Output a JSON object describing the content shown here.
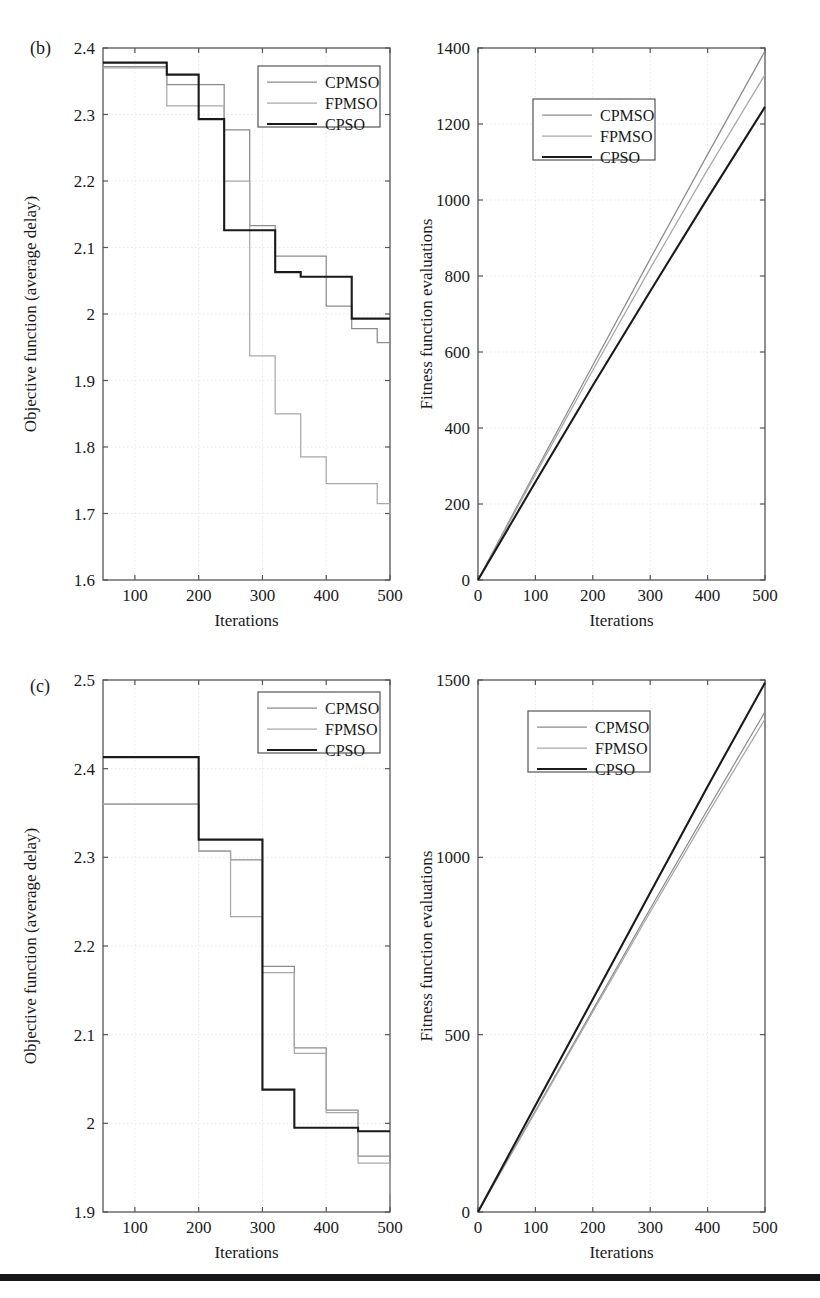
{
  "figure": {
    "panels": [
      "b",
      "c"
    ],
    "series_names": [
      "CPMSO",
      "FPMSO",
      "CPSO"
    ],
    "series_colors": [
      "#8c8c8c",
      "#a8a8a8",
      "#1a1a1a"
    ],
    "bottom_rule_color": "#17171a"
  },
  "panel_b": {
    "tag": "(b)",
    "left": {
      "xlabel": "Iterations",
      "ylabel": "Objective function (average delay)",
      "xticks": [
        "100",
        "200",
        "300",
        "400",
        "500"
      ],
      "yticks": [
        "1.6",
        "1.7",
        "1.8",
        "1.9",
        "2",
        "2.1",
        "2.2",
        "2.3",
        "2.4"
      ],
      "legend": [
        "CPMSO",
        "FPMSO",
        "CPSO"
      ]
    },
    "right": {
      "xlabel": "Iterations",
      "ylabel": "Fitness function evaluations",
      "xticks": [
        "0",
        "100",
        "200",
        "300",
        "400",
        "500"
      ],
      "yticks": [
        "0",
        "200",
        "400",
        "600",
        "800",
        "1000",
        "1200",
        "1400"
      ],
      "legend": [
        "CPMSO",
        "FPMSO",
        "CPSO"
      ]
    }
  },
  "panel_c": {
    "tag": "(c)",
    "left": {
      "xlabel": "Iterations",
      "ylabel": "Objective function (average delay)",
      "xticks": [
        "100",
        "200",
        "300",
        "400",
        "500"
      ],
      "yticks": [
        "1.9",
        "2",
        "2.1",
        "2.2",
        "2.3",
        "2.4",
        "2.5"
      ],
      "legend": [
        "CPMSO",
        "FPMSO",
        "CPSO"
      ]
    },
    "right": {
      "xlabel": "Iterations",
      "ylabel": "Fitness function evaluations",
      "xticks": [
        "0",
        "100",
        "200",
        "300",
        "400",
        "500"
      ],
      "yticks": [
        "0",
        "500",
        "1000",
        "1500"
      ],
      "legend": [
        "CPMSO",
        "FPMSO",
        "CPSO"
      ]
    }
  },
  "chart_data": [
    {
      "id": "b-left",
      "type": "line",
      "step": true,
      "title": "(b) Objective function vs iterations",
      "xlabel": "Iterations",
      "ylabel": "Objective function (average delay)",
      "xlim": [
        50,
        500
      ],
      "ylim": [
        1.6,
        2.4
      ],
      "xticks": [
        100,
        200,
        300,
        400,
        500
      ],
      "yticks": [
        1.6,
        1.7,
        1.8,
        1.9,
        2.0,
        2.1,
        2.2,
        2.3,
        2.4
      ],
      "grid": true,
      "legend_position": "top-right",
      "series": [
        {
          "name": "CPMSO",
          "color": "#8c8c8c",
          "x": [
            50,
            100,
            150,
            200,
            240,
            280,
            320,
            360,
            400,
            440,
            480,
            500
          ],
          "values": [
            2.372,
            2.372,
            2.345,
            2.345,
            2.277,
            2.133,
            2.087,
            2.087,
            2.012,
            1.978,
            1.957,
            1.937
          ]
        },
        {
          "name": "FPMSO",
          "color": "#a8a8a8",
          "x": [
            50,
            100,
            150,
            200,
            240,
            280,
            320,
            360,
            400,
            440,
            480,
            500
          ],
          "values": [
            2.37,
            2.37,
            2.313,
            2.313,
            2.2,
            1.937,
            1.85,
            1.785,
            1.745,
            1.745,
            1.715,
            1.699
          ]
        },
        {
          "name": "CPSO",
          "color": "#1a1a1a",
          "x": [
            50,
            100,
            150,
            200,
            240,
            280,
            320,
            360,
            400,
            440,
            480,
            500
          ],
          "values": [
            2.378,
            2.378,
            2.36,
            2.293,
            2.126,
            2.126,
            2.063,
            2.056,
            2.056,
            1.993,
            1.993,
            1.993
          ]
        }
      ]
    },
    {
      "id": "b-right",
      "type": "line",
      "step": false,
      "title": "(b) Fitness function evaluations vs iterations",
      "xlabel": "Iterations",
      "ylabel": "Fitness function evaluations",
      "xlim": [
        0,
        500
      ],
      "ylim": [
        0,
        1400
      ],
      "xticks": [
        0,
        100,
        200,
        300,
        400,
        500
      ],
      "yticks": [
        0,
        200,
        400,
        600,
        800,
        1000,
        1200,
        1400
      ],
      "grid": true,
      "legend_position": "upper-center",
      "series": [
        {
          "name": "CPMSO",
          "color": "#8c8c8c",
          "x": [
            0,
            100,
            200,
            300,
            400,
            500
          ],
          "values": [
            0,
            285,
            565,
            845,
            1120,
            1392
          ]
        },
        {
          "name": "FPMSO",
          "color": "#a8a8a8",
          "x": [
            0,
            100,
            200,
            300,
            400,
            500
          ],
          "values": [
            0,
            278,
            552,
            820,
            1080,
            1330
          ]
        },
        {
          "name": "CPSO",
          "color": "#1a1a1a",
          "x": [
            0,
            100,
            200,
            300,
            400,
            500
          ],
          "values": [
            0,
            258,
            512,
            760,
            1005,
            1245
          ]
        }
      ]
    },
    {
      "id": "c-left",
      "type": "line",
      "step": true,
      "title": "(c) Objective function vs iterations",
      "xlabel": "Iterations",
      "ylabel": "Objective function (average delay)",
      "xlim": [
        50,
        500
      ],
      "ylim": [
        1.9,
        2.5
      ],
      "xticks": [
        100,
        200,
        300,
        400,
        500
      ],
      "yticks": [
        1.9,
        2.0,
        2.1,
        2.2,
        2.3,
        2.4,
        2.5
      ],
      "grid": true,
      "legend_position": "top-right",
      "series": [
        {
          "name": "CPMSO",
          "color": "#8c8c8c",
          "x": [
            50,
            150,
            200,
            250,
            300,
            350,
            400,
            450,
            500
          ],
          "values": [
            2.36,
            2.36,
            2.307,
            2.297,
            2.177,
            2.085,
            2.015,
            1.963,
            1.935
          ]
        },
        {
          "name": "FPMSO",
          "color": "#a8a8a8",
          "x": [
            50,
            150,
            200,
            250,
            300,
            350,
            400,
            450,
            500
          ],
          "values": [
            2.36,
            2.36,
            2.307,
            2.233,
            2.17,
            2.079,
            2.012,
            1.955,
            1.92
          ]
        },
        {
          "name": "CPSO",
          "color": "#1a1a1a",
          "x": [
            50,
            150,
            200,
            250,
            300,
            350,
            400,
            450,
            500
          ],
          "values": [
            2.413,
            2.413,
            2.32,
            2.32,
            2.038,
            1.995,
            1.995,
            1.991,
            1.991
          ]
        }
      ]
    },
    {
      "id": "c-right",
      "type": "line",
      "step": false,
      "title": "(c) Fitness function evaluations vs iterations",
      "xlabel": "Iterations",
      "ylabel": "Fitness function evaluations",
      "xlim": [
        0,
        500
      ],
      "ylim": [
        0,
        1500
      ],
      "xticks": [
        0,
        100,
        200,
        300,
        400,
        500
      ],
      "yticks": [
        0,
        500,
        1000,
        1500
      ],
      "grid": true,
      "legend_position": "upper-center",
      "series": [
        {
          "name": "CPMSO",
          "color": "#8c8c8c",
          "x": [
            0,
            100,
            200,
            300,
            400,
            500
          ],
          "values": [
            0,
            285,
            570,
            855,
            1135,
            1410
          ]
        },
        {
          "name": "FPMSO",
          "color": "#a8a8a8",
          "x": [
            0,
            100,
            200,
            300,
            400,
            500
          ],
          "values": [
            0,
            282,
            564,
            846,
            1122,
            1390
          ]
        },
        {
          "name": "CPSO",
          "color": "#1a1a1a",
          "x": [
            0,
            100,
            200,
            300,
            400,
            500
          ],
          "values": [
            0,
            300,
            600,
            900,
            1200,
            1492
          ]
        }
      ]
    }
  ]
}
